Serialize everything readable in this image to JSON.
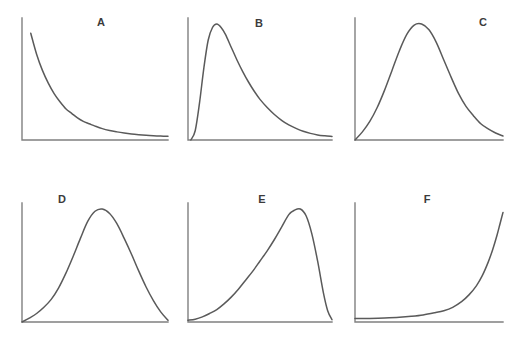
{
  "figure": {
    "title": "",
    "background_color": "#ffffff",
    "curve_color": "#5a5a5a",
    "axis_color": "#808080",
    "label_color": "#3b3b3b",
    "width": 523,
    "height": 337,
    "columns": 3,
    "rows": 2
  },
  "chart_data": {
    "type": "line",
    "title": "",
    "xlabel": "",
    "ylabel": "",
    "grid": false,
    "legend": "none",
    "axis_ticks": false,
    "panels": [
      {
        "id": "A",
        "label": "A",
        "shape": "exponential-decay",
        "label_position": "top-center",
        "peak_x_fraction": 0.0,
        "xlim": [
          0,
          1
        ],
        "ylim": [
          0,
          1
        ],
        "x": [
          0.06,
          0.1,
          0.14,
          0.18,
          0.22,
          0.26,
          0.3,
          0.34,
          0.38,
          0.42,
          0.46,
          0.5,
          0.55,
          0.6,
          0.65,
          0.7,
          0.75,
          0.8,
          0.85,
          0.9,
          0.95,
          1.0
        ],
        "y": [
          0.92,
          0.74,
          0.6,
          0.49,
          0.4,
          0.33,
          0.27,
          0.23,
          0.19,
          0.16,
          0.14,
          0.12,
          0.098,
          0.082,
          0.07,
          0.06,
          0.052,
          0.046,
          0.041,
          0.037,
          0.034,
          0.032
        ]
      },
      {
        "id": "B",
        "label": "B",
        "shape": "right-skewed",
        "label_position": "top-center",
        "peak_x_fraction": 0.2,
        "xlim": [
          0,
          1
        ],
        "ylim": [
          0,
          1
        ],
        "x": [
          0.02,
          0.05,
          0.08,
          0.11,
          0.14,
          0.17,
          0.2,
          0.23,
          0.26,
          0.3,
          0.34,
          0.38,
          0.42,
          0.46,
          0.5,
          0.55,
          0.6,
          0.65,
          0.7,
          0.75,
          0.8,
          0.85,
          0.9,
          0.95,
          1.0
        ],
        "y": [
          0.0,
          0.08,
          0.32,
          0.62,
          0.86,
          0.97,
          1.0,
          0.97,
          0.91,
          0.8,
          0.69,
          0.59,
          0.5,
          0.42,
          0.35,
          0.28,
          0.22,
          0.17,
          0.13,
          0.1,
          0.075,
          0.057,
          0.044,
          0.036,
          0.03
        ]
      },
      {
        "id": "C",
        "label": "C",
        "shape": "slightly-right-skewed-bell",
        "label_position": "top-right",
        "peak_x_fraction": 0.45,
        "xlim": [
          0,
          1
        ],
        "ylim": [
          0,
          1
        ],
        "x": [
          0.0,
          0.05,
          0.1,
          0.15,
          0.2,
          0.25,
          0.3,
          0.35,
          0.4,
          0.45,
          0.5,
          0.55,
          0.6,
          0.65,
          0.7,
          0.75,
          0.8,
          0.85,
          0.9,
          0.95,
          1.0
        ],
        "y": [
          0.0,
          0.07,
          0.16,
          0.28,
          0.43,
          0.6,
          0.77,
          0.91,
          0.99,
          1.0,
          0.95,
          0.84,
          0.69,
          0.54,
          0.4,
          0.29,
          0.21,
          0.14,
          0.095,
          0.06,
          0.035
        ]
      },
      {
        "id": "D",
        "label": "D",
        "shape": "symmetric-bell",
        "label_position": "top-left",
        "peak_x_fraction": 0.55,
        "xlim": [
          0,
          1
        ],
        "ylim": [
          0,
          1
        ],
        "x": [
          0.0,
          0.05,
          0.1,
          0.15,
          0.2,
          0.25,
          0.3,
          0.35,
          0.4,
          0.45,
          0.5,
          0.55,
          0.6,
          0.65,
          0.7,
          0.75,
          0.8,
          0.85,
          0.9,
          0.95,
          1.0
        ],
        "y": [
          0.0,
          0.035,
          0.075,
          0.13,
          0.2,
          0.3,
          0.43,
          0.58,
          0.74,
          0.89,
          0.98,
          1.0,
          0.96,
          0.87,
          0.74,
          0.6,
          0.45,
          0.31,
          0.19,
          0.09,
          0.015
        ]
      },
      {
        "id": "E",
        "label": "E",
        "shape": "left-skewed",
        "label_position": "top-center",
        "peak_x_fraction": 0.78,
        "xlim": [
          0,
          1
        ],
        "ylim": [
          0,
          1
        ],
        "x": [
          0.0,
          0.05,
          0.1,
          0.15,
          0.2,
          0.25,
          0.3,
          0.35,
          0.4,
          0.45,
          0.5,
          0.55,
          0.6,
          0.65,
          0.7,
          0.74,
          0.78,
          0.82,
          0.86,
          0.9,
          0.94,
          0.97,
          1.0
        ],
        "y": [
          0.015,
          0.025,
          0.045,
          0.075,
          0.11,
          0.16,
          0.22,
          0.29,
          0.37,
          0.45,
          0.54,
          0.63,
          0.73,
          0.84,
          0.95,
          0.99,
          1.0,
          0.94,
          0.78,
          0.54,
          0.26,
          0.1,
          0.02
        ]
      },
      {
        "id": "F",
        "label": "F",
        "shape": "exponential-growth",
        "label_position": "top-center",
        "peak_x_fraction": 1.0,
        "xlim": [
          0,
          1
        ],
        "ylim": [
          0,
          1
        ],
        "x": [
          0.0,
          0.1,
          0.2,
          0.3,
          0.38,
          0.46,
          0.54,
          0.6,
          0.66,
          0.72,
          0.77,
          0.82,
          0.86,
          0.9,
          0.93,
          0.96,
          0.98,
          1.0
        ],
        "y": [
          0.03,
          0.032,
          0.036,
          0.042,
          0.05,
          0.062,
          0.082,
          0.1,
          0.13,
          0.18,
          0.24,
          0.32,
          0.41,
          0.53,
          0.64,
          0.77,
          0.87,
          0.97
        ]
      }
    ]
  }
}
